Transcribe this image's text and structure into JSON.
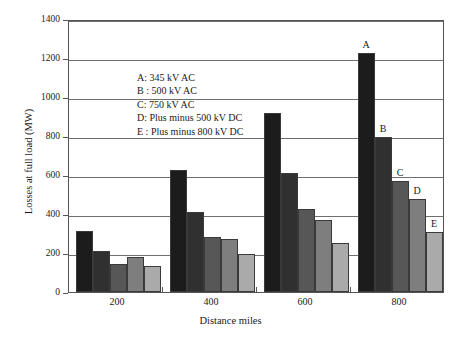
{
  "chart_data": {
    "type": "bar",
    "title": "",
    "xlabel": "Distance miles",
    "ylabel": "Losses at full load (MW)",
    "categories": [
      "200",
      "400",
      "600",
      "800"
    ],
    "ylim": [
      0,
      1400
    ],
    "yticks": [
      0,
      200,
      400,
      600,
      800,
      1000,
      1200,
      1400
    ],
    "grid": true,
    "legend_position": "inside-upper-left",
    "series": [
      {
        "name": "A",
        "label": "A: 345 kV AC",
        "color": "#1c1c1c",
        "values": [
          315,
          625,
          920,
          1228
        ]
      },
      {
        "name": "B",
        "label": "B : 500 kV AC",
        "color": "#303030",
        "values": [
          208,
          410,
          608,
          795
        ]
      },
      {
        "name": "C",
        "label": "C: 750 kV AC",
        "color": "#575757",
        "values": [
          143,
          282,
          425,
          568
        ]
      },
      {
        "name": "D",
        "label": "D: Plus minus 500 kV DC",
        "color": "#7e7e7e",
        "values": [
          180,
          272,
          370,
          478
        ]
      },
      {
        "name": "E",
        "label": "E : Plus minus 800 kV DC",
        "color": "#aaaaaa",
        "values": [
          135,
          195,
          250,
          310
        ]
      }
    ],
    "annotations": [
      {
        "text": "A",
        "group": "800",
        "series": "A"
      },
      {
        "text": "B",
        "group": "800",
        "series": "B"
      },
      {
        "text": "C",
        "group": "800",
        "series": "C"
      },
      {
        "text": "D",
        "group": "800",
        "series": "D"
      },
      {
        "text": "E",
        "group": "800",
        "series": "E"
      }
    ]
  },
  "axes": {
    "ytick_labels": [
      "1400",
      "1200",
      "1000",
      "800",
      "600",
      "400",
      "200",
      "0"
    ],
    "ylabel": "Losses at full load (MW)",
    "xtick_labels": [
      "200",
      "400",
      "600",
      "800"
    ],
    "xlabel": "Distance miles"
  },
  "legend": {
    "rows": [
      "A: 345 kV AC",
      "B : 500 kV AC",
      "C: 750 kV AC",
      "D: Plus minus 500 kV DC",
      "E : Plus minus 800 kV DC"
    ]
  }
}
